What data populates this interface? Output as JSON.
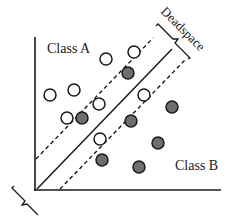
{
  "diagram": {
    "labels": {
      "class_a": "Class A",
      "class_b": "Class B",
      "deadspace": "Deadspace"
    },
    "colors": {
      "stroke": "#1a1a1a",
      "filled_point": "#6e6e6e",
      "open_point": "#ffffff"
    },
    "axes": {
      "origin": [
        35,
        190
      ],
      "y_top": [
        35,
        37
      ],
      "x_right": [
        221,
        190
      ]
    },
    "lines": {
      "decision_boundary": {
        "style": "solid",
        "from": [
          37,
          189
        ],
        "to": [
          172,
          49
        ]
      },
      "margin_upper": {
        "style": "dashed",
        "from": [
          36,
          159
        ],
        "to": [
          153,
          38
        ]
      },
      "margin_lower": {
        "style": "dashed",
        "from": [
          60,
          189
        ],
        "to": [
          185,
          60
        ]
      }
    },
    "points_class_a_open": [
      [
        106,
        59
      ],
      [
        134,
        52
      ],
      [
        50,
        95
      ],
      [
        74,
        90
      ],
      [
        99,
        104
      ],
      [
        67,
        118
      ],
      [
        144,
        95
      ],
      [
        100,
        139
      ]
    ],
    "points_class_b_filled": [
      [
        128,
        73
      ],
      [
        82,
        118
      ],
      [
        131,
        121
      ],
      [
        172,
        107
      ],
      [
        158,
        143
      ],
      [
        102,
        160
      ],
      [
        139,
        167
      ]
    ]
  }
}
